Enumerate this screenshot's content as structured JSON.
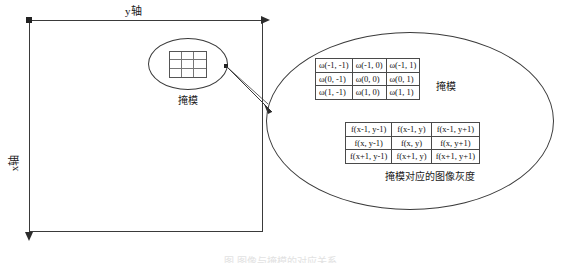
{
  "figure": {
    "axes": {
      "y_axis_label": "y轴",
      "x_axis_label": "x轴"
    },
    "image_region": {
      "name": "image-plane-rectangle"
    },
    "mask_callout": {
      "label": "掩模"
    },
    "zoom_bubble": {
      "mask_side_label": "掩模",
      "gray_caption": "掩模对应的图像灰度",
      "mask_matrix": {
        "rows": [
          [
            "ω(-1, -1)",
            "ω(-1, 0)",
            "ω(-1, 1)"
          ],
          [
            "ω(0, -1)",
            "ω(0, 0)",
            "ω(0, 1)"
          ],
          [
            "ω(1, -1)",
            "ω(1, 0)",
            "ω(1, 1)"
          ]
        ]
      },
      "gray_matrix": {
        "rows": [
          [
            "f(x-1, y-1)",
            "f(x-1, y)",
            "f(x-1, y+1)"
          ],
          [
            "f(x, y-1)",
            "f(x, y)",
            "f(x, y+1)"
          ],
          [
            "f(x+1, y-1)",
            "f(x+1, y)",
            "f(x+1, y+1)"
          ]
        ]
      }
    },
    "caption": "图    图像与掩模的对应关系",
    "colors": {
      "line": "#3a3a3a",
      "text": "#1a1a1a",
      "background": "#ffffff"
    }
  }
}
